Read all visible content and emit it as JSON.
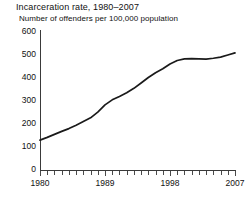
{
  "chart_data": {
    "type": "line",
    "title": "Incarceration rate, 1980–2007",
    "subtitle": "Number of offenders per 100,000 population",
    "xlabel": "",
    "ylabel": "",
    "xlim": [
      1980,
      2007
    ],
    "ylim": [
      0,
      600
    ],
    "grid": false,
    "legend": "none",
    "y_ticks": [
      600,
      500,
      400,
      300,
      200,
      100,
      0
    ],
    "x_ticks": [
      1980,
      1981,
      1982,
      1983,
      1984,
      1985,
      1986,
      1987,
      1988,
      1989,
      1990,
      1991,
      1992,
      1993,
      1994,
      1995,
      1996,
      1997,
      1998,
      1999,
      2000,
      2001,
      2002,
      2003,
      2004,
      2005,
      2006,
      2007
    ],
    "x_tick_labels": [
      "1980",
      "1989",
      "1998",
      "2007"
    ],
    "x_tick_labels_years": [
      1980,
      1989,
      1998,
      2007
    ],
    "line_color": "#1a1a1a",
    "series": [
      {
        "name": "Incarceration rate",
        "x": [
          1980,
          1981,
          1982,
          1983,
          1984,
          1985,
          1986,
          1987,
          1988,
          1989,
          1990,
          1991,
          1992,
          1993,
          1994,
          1995,
          1996,
          1997,
          1998,
          1999,
          2000,
          2001,
          2002,
          2003,
          2004,
          2005,
          2006,
          2007
        ],
        "values": [
          130,
          142,
          155,
          168,
          180,
          195,
          211,
          227,
          252,
          283,
          305,
          320,
          336,
          355,
          378,
          402,
          423,
          440,
          461,
          476,
          483,
          484,
          483,
          482,
          486,
          491,
          500,
          509
        ]
      }
    ]
  }
}
